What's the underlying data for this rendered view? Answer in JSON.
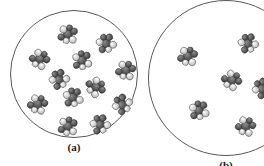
{
  "figure": {
    "background_color": "#ffffff",
    "circle_stroke_color": "#55595c",
    "atom_dark_color": "#4a4a4a",
    "atom_light_color": "#e8e8e8",
    "label_color": "#1a1a1a"
  },
  "chart_data": {
    "type": "scatter",
    "title": "",
    "xlabel": "",
    "ylabel": "",
    "grid": false,
    "legend": "none",
    "panels": [
      {
        "id": "a",
        "label": "(a)",
        "description": "concentrated solution",
        "molecule_count": 12,
        "circle": {
          "cx": 74,
          "cy": 74,
          "r": 64,
          "clipped": false
        },
        "molecules": [
          {
            "x": 68,
            "y": 34,
            "rot": 12
          },
          {
            "x": 106,
            "y": 43,
            "rot": -25
          },
          {
            "x": 40,
            "y": 59,
            "rot": 40
          },
          {
            "x": 82,
            "y": 60,
            "rot": -8
          },
          {
            "x": 126,
            "y": 70,
            "rot": 22
          },
          {
            "x": 59,
            "y": 79,
            "rot": -40
          },
          {
            "x": 96,
            "y": 87,
            "rot": 60
          },
          {
            "x": 73,
            "y": 97,
            "rot": -15
          },
          {
            "x": 38,
            "y": 104,
            "rot": 28
          },
          {
            "x": 122,
            "y": 104,
            "rot": -52
          },
          {
            "x": 68,
            "y": 126,
            "rot": 8
          },
          {
            "x": 100,
            "y": 124,
            "rot": -30
          }
        ]
      },
      {
        "id": "b",
        "label": "(b)",
        "description": "dilute solution",
        "molecule_count": 6,
        "circle": {
          "cx": 226,
          "cy": 78,
          "r": 78,
          "clipped": true
        },
        "molecules": [
          {
            "x": 188,
            "y": 56,
            "rot": 18
          },
          {
            "x": 248,
            "y": 43,
            "rot": -28
          },
          {
            "x": 232,
            "y": 80,
            "rot": 45
          },
          {
            "x": 199,
            "y": 110,
            "rot": -12
          },
          {
            "x": 246,
            "y": 126,
            "rot": 30
          },
          {
            "x": 262,
            "y": 88,
            "rot": -48
          }
        ]
      }
    ]
  },
  "labels": {
    "panel_a": "(a)",
    "panel_b": "(b)"
  }
}
